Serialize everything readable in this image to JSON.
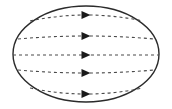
{
  "figure": {
    "canvas": {
      "width": 172,
      "height": 109,
      "background_color": "#ffffff"
    },
    "boundary": {
      "shape_name": "ellipse",
      "center_x": 86,
      "center_y": 54,
      "radius_x": 73,
      "radius_y": 48,
      "stroke_color": "#2b2b2b",
      "stroke_width": 1.4,
      "fill": "none"
    },
    "field_lines": {
      "count": 5,
      "direction": "left-to-right",
      "stroke_color": "#4a4a4a",
      "stroke_width": 1.1,
      "dash_pattern": "3 3",
      "arrow_color": "#1a1a1a",
      "arrow_x": 86,
      "arrow_width": 9,
      "arrow_height": 8,
      "lines": [
        {
          "label": "field-line-1",
          "y_center": 21,
          "x_start": 30,
          "x_end": 143,
          "curve_offset": -6,
          "arrow_y": 21
        },
        {
          "label": "field-line-2",
          "y_center": 39,
          "x_start": 18,
          "x_end": 154,
          "curve_offset": -3,
          "arrow_y": 39
        },
        {
          "label": "field-line-3",
          "y_center": 55,
          "x_start": 13,
          "x_end": 159,
          "curve_offset": 0,
          "arrow_y": 55
        },
        {
          "label": "field-line-4",
          "y_center": 70,
          "x_start": 18,
          "x_end": 154,
          "curve_offset": 3,
          "arrow_y": 70
        },
        {
          "label": "field-line-5",
          "y_center": 88,
          "x_start": 30,
          "x_end": 143,
          "curve_offset": 6,
          "arrow_y": 88
        }
      ]
    }
  }
}
